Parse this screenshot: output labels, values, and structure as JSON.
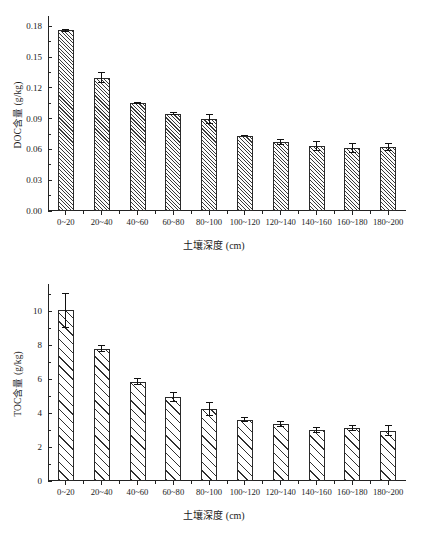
{
  "figure": {
    "width": 428,
    "height": 540,
    "background": "#ffffff",
    "line_color": "#222222"
  },
  "chart_data": [
    {
      "id": "doc",
      "type": "bar",
      "title": "",
      "xlabel": "土壤深度 (cm)",
      "ylabel": "DOC含量 (g/kg)",
      "ylim": [
        0,
        0.19
      ],
      "yticks": [
        0,
        0.03,
        0.06,
        0.09,
        0.12,
        0.15,
        0.18
      ],
      "ytick_labels": [
        "0.00",
        "0.03",
        "0.06",
        "0.09",
        "0.12",
        "0.15",
        "0.18"
      ],
      "minor_ticks": true,
      "grid": false,
      "legend": null,
      "categories": [
        "0~20",
        "20~40",
        "40~60",
        "60~80",
        "80~100",
        "100~120",
        "120~140",
        "140~160",
        "160~180",
        "180~200"
      ],
      "values": [
        0.176,
        0.13,
        0.105,
        0.095,
        0.09,
        0.0735,
        0.067,
        0.063,
        0.0615,
        0.0625
      ],
      "errors": [
        0.0015,
        0.005,
        0.0012,
        0.0012,
        0.005,
        0.0008,
        0.003,
        0.005,
        0.005,
        0.004
      ],
      "hatch": "dense-diagonal",
      "bar_fill": "#fcfcfc",
      "bar_edge": "#2a2a2a"
    },
    {
      "id": "toc",
      "type": "bar",
      "title": "",
      "xlabel": "土壤深度 (cm)",
      "ylabel": "TOC含量 (g/kg)",
      "ylim": [
        0,
        11.6
      ],
      "yticks": [
        0,
        2,
        4,
        6,
        8,
        10
      ],
      "ytick_labels": [
        "0",
        "2",
        "4",
        "6",
        "8",
        "10"
      ],
      "minor_ticks": true,
      "grid": false,
      "legend": null,
      "categories": [
        "0~20",
        "20~40",
        "40~60",
        "60~80",
        "80~100",
        "100~120",
        "120~140",
        "140~160",
        "160~180",
        "180~200"
      ],
      "values": [
        10.05,
        7.8,
        5.85,
        4.95,
        4.25,
        3.6,
        3.35,
        3.0,
        3.1,
        2.95
      ],
      "errors": [
        1.05,
        0.22,
        0.22,
        0.28,
        0.4,
        0.15,
        0.18,
        0.18,
        0.18,
        0.32
      ],
      "hatch": "sparse-diagonal",
      "bar_fill": "#ffffff",
      "bar_edge": "#303030"
    }
  ]
}
